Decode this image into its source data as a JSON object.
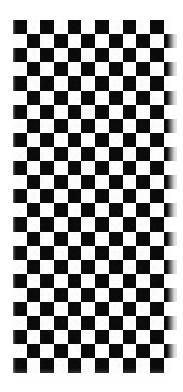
{
  "image": {
    "subject": "checkerboard-pattern",
    "description": "Black and white checkerboard grid on a white background, fading to white at the bottom edge",
    "width": 183,
    "height": 392,
    "background_color": "#fefefe"
  },
  "board": {
    "columns": 12,
    "rows": 25,
    "cell_width": 13.7,
    "cell_height": 14.1,
    "offset_x": 13,
    "offset_y": 20,
    "dark_color": "#0a0a0a",
    "light_color": "#fdfdfd",
    "first_cell_is_dark": true
  },
  "effects": {
    "bottom_fade": {
      "name": "bottom-fade-to-white",
      "start_y": 368,
      "height": 24,
      "color": "#ffffff"
    },
    "edge_haze": {
      "name": "edge-haze",
      "width": 16,
      "color": "#ffffff"
    }
  }
}
